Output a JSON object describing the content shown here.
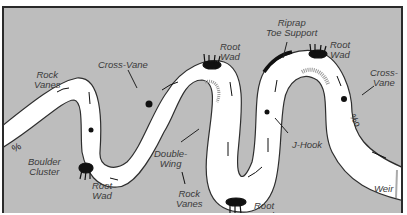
{
  "diagram": {
    "type": "river-meander-restoration-structures",
    "background_color": "#bdbdbd",
    "channel_color": "#ffffff",
    "labels": [
      {
        "id": "rock-vanes-left",
        "text": "Rock\nVanes",
        "x": 22,
        "y": 62
      },
      {
        "id": "cross-vane-left",
        "text": "Cross-Vane",
        "x": 96,
        "y": 52
      },
      {
        "id": "root-wad-top-middle",
        "text": "Root\nWad",
        "x": 216,
        "y": 38
      },
      {
        "id": "riprap-toe-support",
        "text": "Riprap\nToe Support",
        "x": 262,
        "y": 13
      },
      {
        "id": "root-wad-top-right",
        "text": "Root\nWad",
        "x": 328,
        "y": 36
      },
      {
        "id": "cross-vane-right",
        "text": "Cross-\nVane",
        "x": 366,
        "y": 64
      },
      {
        "id": "boulder-cluster",
        "text": "Boulder\nCluster",
        "x": 26,
        "y": 154
      },
      {
        "id": "root-wad-bottom-left",
        "text": "Root\nWad",
        "x": 88,
        "y": 177
      },
      {
        "id": "double-wing",
        "text": "Double-\nWing",
        "x": 150,
        "y": 144
      },
      {
        "id": "j-hook",
        "text": "J-Hook",
        "x": 289,
        "y": 132
      },
      {
        "id": "rock-vanes-bottom",
        "text": "Rock\nVanes",
        "x": 172,
        "y": 184
      },
      {
        "id": "root-wad-bottom-middle",
        "text": "Root\nWad",
        "x": 249,
        "y": 196
      },
      {
        "id": "weir",
        "text": "Weir",
        "x": 373,
        "y": 179
      }
    ]
  }
}
